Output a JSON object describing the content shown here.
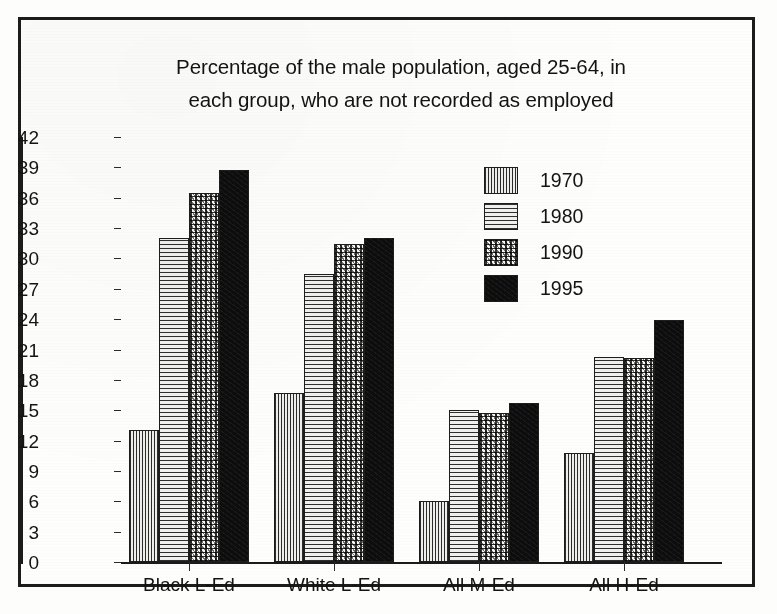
{
  "chart_data": {
    "type": "bar",
    "title": "Percentage of the male population, aged 25-64, in each group, who are not recorded as employed",
    "title_lines": [
      "Percentage of the male population, aged 25-64, in",
      "each group, who are not recorded as employed"
    ],
    "xlabel": "",
    "ylabel": "",
    "categories": [
      "Black L-Ed",
      "White L-Ed",
      "All M-Ed",
      "All H-Ed"
    ],
    "series": [
      {
        "name": "1970",
        "values": [
          13.0,
          16.7,
          6.0,
          10.8
        ],
        "pattern": "vertical-hatch"
      },
      {
        "name": "1980",
        "values": [
          32.0,
          28.5,
          15.0,
          20.3
        ],
        "pattern": "horizontal-hatch"
      },
      {
        "name": "1990",
        "values": [
          36.5,
          31.4,
          14.7,
          20.2
        ],
        "pattern": "speckle"
      },
      {
        "name": "1995",
        "values": [
          38.7,
          32.0,
          15.7,
          23.9
        ],
        "pattern": "solid-black"
      }
    ],
    "ylim": [
      0,
      42
    ],
    "ytick_step": 3,
    "yticks": [
      0,
      3,
      6,
      9,
      12,
      15,
      18,
      21,
      24,
      27,
      30,
      33,
      36,
      39,
      42
    ],
    "grid": false,
    "legend_position": "inside-top-center",
    "legend_entries": [
      "1970",
      "1980",
      "1990",
      "1995"
    ],
    "colors": {
      "axis": "#1b1b1b",
      "text": "#131313",
      "series_1995": "#0d0d0d",
      "background": "#fefefd",
      "frame": "#1c1c1c"
    }
  }
}
